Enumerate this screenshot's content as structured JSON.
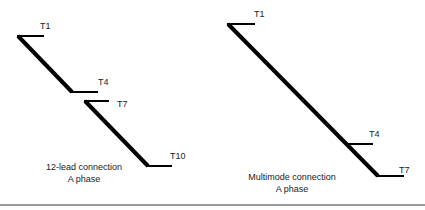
{
  "diagrams": [
    {
      "caption_line1": "12-lead connection",
      "caption_line2": "A phase",
      "terminals": [
        "T1",
        "T4",
        "T7",
        "T10"
      ]
    },
    {
      "caption_line1": "Multimode connection",
      "caption_line2": "A phase",
      "terminals": [
        "T1",
        "T4",
        "T7"
      ]
    }
  ],
  "colors": {
    "stroke": "#000000",
    "text": "#222222",
    "rule": "#9a9a9a"
  }
}
